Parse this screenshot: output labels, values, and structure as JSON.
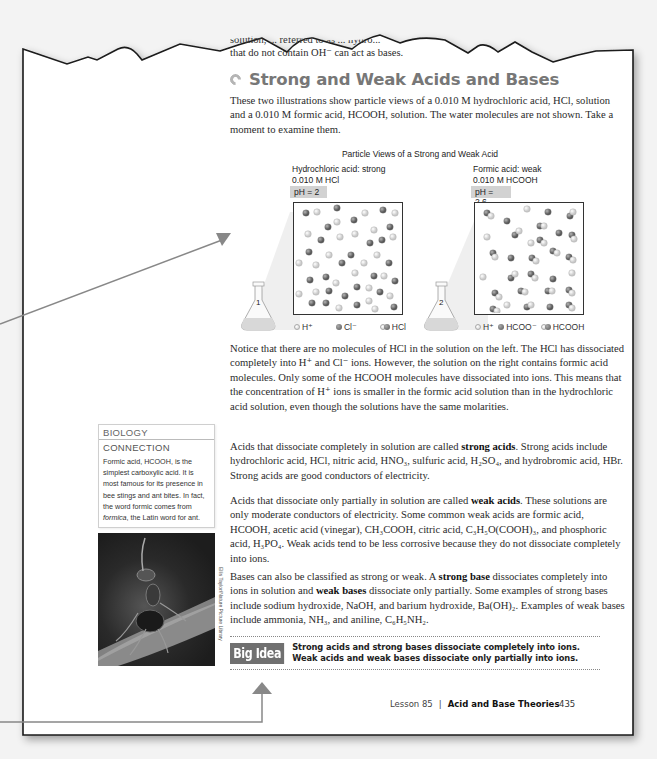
{
  "torn_top_fragment": "solution, ... referred to as ... hydro...",
  "intro_tail": "that do not contain OH⁻ can act as bases.",
  "section": {
    "heading": "Strong and Weak Acids and Bases",
    "heading_icon": "section-arrow-icon"
  },
  "paragraphs": {
    "p1": "These two illustrations show particle views of a 0.010 M hydrochloric acid, HCl, solution and a 0.010 M formic acid, HCOOH, solution. The water molecules are not shown. Take a moment to examine them.",
    "p2": "Notice that there are no molecules of HCl in the solution on the left. The HCl has dissociated completely into H⁺ and Cl⁻ ions. However, the solution on the right contains formic acid molecules. Only some of the HCOOH molecules have dissociated into ions. This means that the concentration of H⁺ ions is smaller in the formic acid solution than in the hydrochloric acid solution, even though the solutions have the same molarities.",
    "p3_pre": "Acids that dissociate completely in solution are called ",
    "p3_bold": "strong acids",
    "p3_post": ". Strong acids include hydrochloric acid, HCl, nitric acid, HNO₃, sulfuric acid, H₂SO₄, and hydrobromic acid, HBr. Strong acids are good conductors of electricity.",
    "p4_pre": "Acids that dissociate only partially in solution are called ",
    "p4_bold": "weak acids",
    "p4_post": ". These solutions are only moderate conductors of electricity. Some common weak acids are formic acid, HCOOH, acetic acid (vinegar), CH₃COOH, citric acid, C₃H₅O(COOH)₃, and phosphoric acid, H₃PO₄. Weak acids tend to be less corrosive because they do not dissociate completely into ions.",
    "p5_a": "Bases can also be classified as strong or weak. A ",
    "p5_bold1": "strong base",
    "p5_b": " dissociates completely into ions in solution and ",
    "p5_bold2": "weak bases",
    "p5_c": " dissociate only partially. Some examples of strong bases include sodium hydroxide, NaOH, and barium hydroxide, Ba(OH)₂. Examples of weak bases include ammonia, NH₃, and aniline, C₆H₅NH₂."
  },
  "figure": {
    "title": "Particle Views of a Strong and Weak Acid",
    "left": {
      "label": "Hydrochloric acid: strong",
      "concentration": "0.010 M HCl",
      "ph": "pH = 2",
      "flask_number": "1",
      "legend": [
        "H⁺",
        "Cl⁻",
        "HCl"
      ]
    },
    "right": {
      "label": "Formic acid: weak",
      "concentration": "0.010 M HCOOH",
      "ph": "pH = 2.6",
      "flask_number": "2",
      "legend": [
        "H⁺",
        "HCOO⁻",
        "HCOOH"
      ]
    }
  },
  "sidebar": {
    "title_line1": "BIOLOGY",
    "title_line2": "CONNECTION",
    "text_pre": "Formic acid, HCOOH, is the simplest carboxylic acid. It is most famous for its presence in bee stings and ant bites. In fact, the word formic comes from ",
    "text_italic": "formica",
    "text_post": ", the Latin word for ant.",
    "photo_credit": "Ellis Taylor/Nature Picture Library"
  },
  "big_idea": {
    "badge": "Big Idea",
    "line1": "Strong acids and strong bases dissociate completely into ions.",
    "line2": "Weak acids and weak bases dissociate only partially into ions."
  },
  "footer": {
    "lesson": "Lesson 85",
    "separator": "|",
    "topic": "Acid and Base Theories",
    "page_number": "435"
  },
  "colors": {
    "heading": "#777777",
    "big_idea_badge": "#707070",
    "arrow": "#888888",
    "background": "#f3f3f3",
    "page": "#ffffff"
  }
}
